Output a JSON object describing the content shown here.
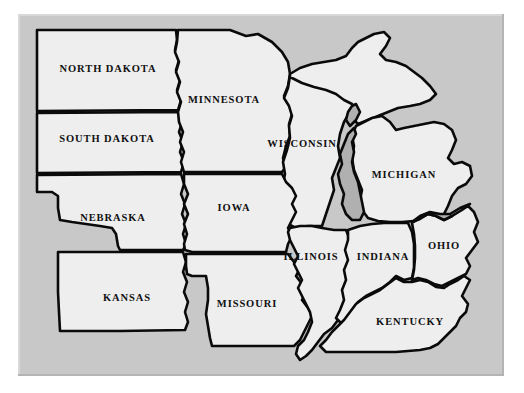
{
  "map": {
    "title": "Midwestern United States outline map",
    "colors": {
      "page_background": "#ffffff",
      "panel_background": "#c8c8c8",
      "panel_highlight": "#d8d8d8",
      "panel_shadow": "#b4b4b4",
      "state_fill": "#eeeeee",
      "lake_fill": "#b0b0b0",
      "border_stroke": "#0a0a0a",
      "label_color": "#111111"
    },
    "states": [
      {
        "id": "north-dakota",
        "label": "NORTH DAKOTA",
        "label_x": 108,
        "label_y": 70,
        "path": "M 37 30 L 176 30 L 177 40 L 175 50 L 179 60 L 176 70 L 180 80 L 177 90 L 181 100 L 178 110 L 37 111 Z"
      },
      {
        "id": "south-dakota",
        "label": "SOUTH DAKOTA",
        "label_x": 107,
        "label_y": 140,
        "path": "M 37 113 L 178 112 L 182 122 L 179 132 L 183 142 L 180 152 L 184 162 L 181 172 L 37 173 Z"
      },
      {
        "id": "minnesota",
        "label": "MINNESOTA",
        "label_x": 224,
        "label_y": 101,
        "path": "M 178 30 L 230 30 L 246 36 L 258 34 L 272 42 L 282 52 L 288 62 L 290 74 L 288 86 L 284 96 L 289 104 L 292 114 L 289 124 L 290 136 L 286 146 L 283 158 L 285 168 L 282 172 L 184 172 L 181 162 L 184 152 L 180 142 L 183 132 L 179 122 L 178 112 L 181 102 L 177 92 L 180 82 L 176 72 L 179 62 L 175 52 L 177 42 Z"
      },
      {
        "id": "wisconsin",
        "label": "WISCONSIN",
        "label_x": 302,
        "label_y": 145,
        "path": "M 290 76 L 302 82 L 314 86 L 326 88 L 338 92 L 348 98 L 356 104 L 350 112 L 344 122 L 340 134 L 338 146 L 340 158 L 336 168 L 332 178 L 334 190 L 330 202 L 326 214 L 322 226 L 308 226 L 296 228 L 288 224 L 284 214 L 288 204 L 286 194 L 283 184 L 285 174 L 283 162 L 287 150 L 290 138 L 289 126 L 292 116 L 289 106 L 284 98 L 288 88 Z"
      },
      {
        "id": "michigan-upper-peninsula",
        "label": "",
        "label_x": 0,
        "label_y": 0,
        "path": "M 290 74 L 300 68 L 312 64 L 324 62 L 336 60 L 346 56 L 352 48 L 358 42 L 366 38 L 374 34 L 384 32 L 390 38 L 386 46 L 380 54 L 386 60 L 396 62 L 406 66 L 414 72 L 422 78 L 430 86 L 436 94 L 430 100 L 420 104 L 410 106 L 398 108 L 388 112 L 378 116 L 368 120 L 358 124 L 352 118 L 354 110 L 352 104 L 344 100 L 336 94 L 326 90 L 314 87 L 302 83 L 290 77 Z"
      },
      {
        "id": "michigan",
        "label": "MICHIGAN",
        "label_x": 404,
        "label_y": 176,
        "path": "M 356 126 L 364 122 L 372 118 L 382 116 L 390 122 L 396 130 L 404 128 L 414 126 L 424 124 L 434 122 L 444 124 L 452 130 L 456 140 L 452 150 L 448 158 L 454 164 L 462 162 L 470 166 L 472 176 L 466 184 L 458 188 L 452 196 L 448 206 L 444 214 L 436 218 L 426 220 L 414 221 L 402 222 L 390 222 L 378 221 L 368 218 L 362 210 L 360 200 L 362 190 L 358 180 L 354 170 L 352 158 L 354 146 L 352 136 Z"
      },
      {
        "id": "nebraska",
        "label": "NEBRASKA",
        "label_x": 113,
        "label_y": 219,
        "path": "M 37 175 L 181 174 L 184 184 L 181 194 L 185 204 L 182 214 L 186 224 L 183 234 L 186 244 L 183 250 L 120 250 L 118 246 L 116 234 L 112 228 L 100 226 L 86 224 L 72 222 L 60 220 L 58 208 L 58 196 L 52 192 L 44 192 L 37 192 Z"
      },
      {
        "id": "iowa",
        "label": "IOWA",
        "label_x": 234,
        "label_y": 209,
        "path": "M 184 174 L 282 174 L 286 182 L 292 188 L 296 196 L 292 204 L 296 212 L 292 220 L 288 228 L 292 236 L 288 244 L 286 252 L 276 252 L 264 252 L 252 252 L 240 252 L 228 252 L 216 252 L 204 252 L 192 252 L 185 250 L 184 244 L 187 234 L 184 224 L 188 214 L 184 204 L 188 194 L 184 184 Z"
      },
      {
        "id": "kansas",
        "label": "KANSAS",
        "label_x": 127,
        "label_y": 299,
        "path": "M 58 252 L 118 252 L 183 252 L 186 262 L 183 272 L 187 282 L 184 292 L 188 302 L 185 312 L 188 322 L 185 330 L 120 331 L 60 331 L 59 312 L 58 292 L 58 272 Z"
      },
      {
        "id": "missouri",
        "label": "MISSOURI",
        "label_x": 247,
        "label_y": 305,
        "path": "M 186 254 L 288 254 L 294 262 L 300 268 L 296 276 L 302 284 L 306 292 L 302 300 L 308 308 L 312 316 L 308 324 L 304 332 L 300 340 L 294 346 L 282 346 L 268 346 L 254 346 L 240 346 L 226 346 L 212 346 L 210 338 L 208 326 L 206 314 L 208 300 L 208 288 L 206 276 L 192 276 L 187 274 L 186 266 Z"
      },
      {
        "id": "illinois",
        "label": "ILLINOIS",
        "label_x": 311,
        "label_y": 258,
        "path": "M 290 228 L 300 226 L 312 226 L 322 228 L 334 230 L 346 230 L 350 240 L 347 250 L 350 260 L 346 270 L 348 280 L 344 290 L 346 300 L 342 310 L 338 320 L 332 328 L 324 334 L 318 342 L 312 350 L 306 356 L 300 360 L 296 354 L 298 346 L 304 340 L 308 332 L 312 322 L 310 312 L 306 304 L 302 296 L 298 288 L 302 280 L 298 272 L 294 264 L 298 256 L 294 248 L 290 240 L 288 232 Z"
      },
      {
        "id": "indiana",
        "label": "INDIANA",
        "label_x": 383,
        "label_y": 258,
        "path": "M 348 230 L 360 226 L 372 224 L 384 223 L 396 223 L 408 223 L 412 232 L 414 244 L 414 256 L 414 268 L 412 278 L 404 280 L 396 276 L 390 282 L 382 288 L 374 292 L 366 296 L 358 302 L 352 310 L 348 318 L 342 324 L 336 318 L 340 310 L 344 300 L 342 290 L 346 280 L 344 270 L 348 260 L 345 250 L 348 240 Z"
      },
      {
        "id": "ohio",
        "label": "OHIO",
        "label_x": 444,
        "label_y": 247,
        "path": "M 412 223 L 420 218 L 428 214 L 436 216 L 444 220 L 452 216 L 460 210 L 468 206 L 474 212 L 478 222 L 474 232 L 478 242 L 472 250 L 466 258 L 470 266 L 466 274 L 458 278 L 450 282 L 442 286 L 434 284 L 426 280 L 418 278 L 412 280 L 414 270 L 415 258 L 415 246 L 414 234 Z"
      },
      {
        "id": "kentucky",
        "label": "KENTUCKY",
        "label_x": 410,
        "label_y": 323,
        "path": "M 404 282 L 412 282 L 420 280 L 428 282 L 436 287 L 444 288 L 450 284 L 458 280 L 464 276 L 470 280 L 466 288 L 462 296 L 468 304 L 466 312 L 460 318 L 456 326 L 450 332 L 444 338 L 438 344 L 430 348 L 420 350 L 408 351 L 396 352 L 384 352 L 372 352 L 360 352 L 348 352 L 336 352 L 326 352 L 320 346 L 326 340 L 332 332 L 338 326 L 344 320 L 350 312 L 356 304 L 364 298 L 372 294 L 380 290 L 388 284 L 396 278 Z"
      }
    ],
    "lakes": [
      {
        "id": "lake-michigan",
        "path": "M 354 128 L 348 134 L 344 144 L 340 154 L 342 164 L 338 174 L 340 184 L 344 194 L 342 204 L 346 214 L 352 220 L 360 220 L 364 212 L 362 202 L 360 192 L 358 182 L 354 172 L 352 162 L 354 152 L 352 142 L 356 134 Z"
      },
      {
        "id": "lake-michigan-green-bay",
        "path": "M 356 104 L 360 112 L 356 120 L 350 126 L 346 120 L 348 112 L 352 106 Z"
      },
      {
        "id": "lake-erie",
        "path": "M 412 222 L 420 216 L 430 212 L 440 214 L 450 214 L 460 208 L 470 204 L 462 210 L 452 216 L 444 220 L 436 216 L 428 214 L 420 219 Z"
      }
    ]
  }
}
